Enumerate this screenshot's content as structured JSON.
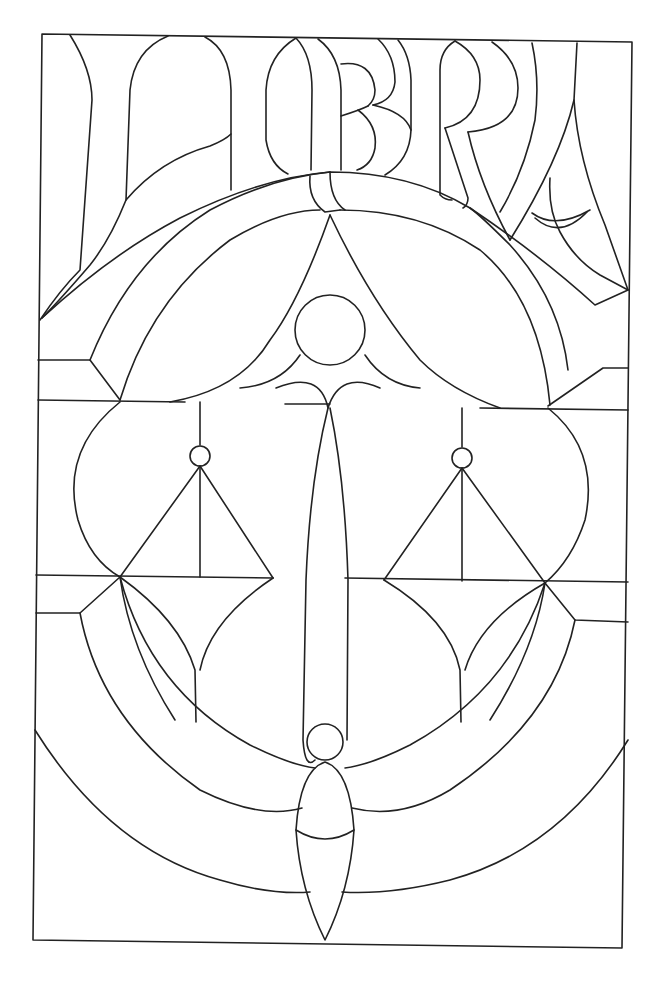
{
  "pattern": {
    "title": "LIBRA",
    "type": "stained-glass line-art pattern",
    "letters": [
      "L",
      "I",
      "B",
      "R",
      "A"
    ],
    "motif": "balance scales",
    "colors": {
      "background": "#ffffff",
      "stroke": "#222222"
    }
  }
}
